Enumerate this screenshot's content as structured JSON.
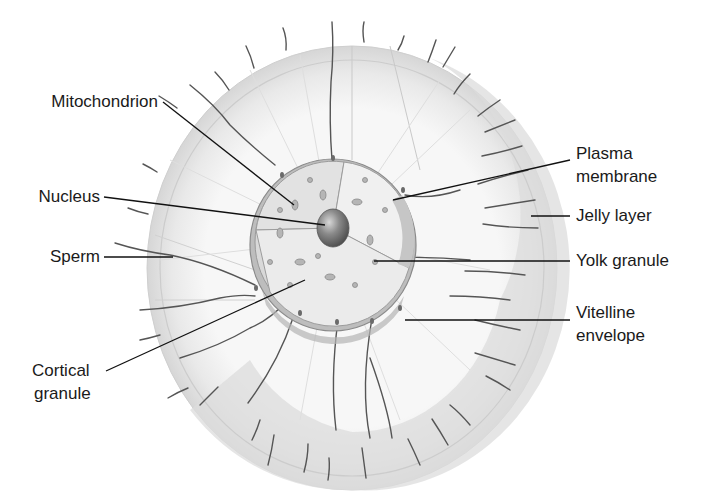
{
  "diagram": {
    "labels": {
      "mitochondrion": "Mitochondrion",
      "nucleus": "Nucleus",
      "sperm": "Sperm",
      "cortical_granule_1": "Cortical",
      "cortical_granule_2": "granule",
      "plasma_membrane_1": "Plasma",
      "plasma_membrane_2": "membrane",
      "jelly_layer": "Jelly layer",
      "yolk_granule": "Yolk granule",
      "vitelline_envelope_1": "Vitelline",
      "vitelline_envelope_2": "envelope"
    },
    "colors": {
      "background": "#ffffff",
      "jelly_outer": "#d9d9d9",
      "jelly_inner": "#f2f2f2",
      "cytoplasm": "#e4e4e4",
      "envelope": "#a8a8a8",
      "nucleus": "#7a7a7a",
      "sperm": "#555555",
      "leader_line": "#111111",
      "text": "#1a1a1a"
    }
  }
}
